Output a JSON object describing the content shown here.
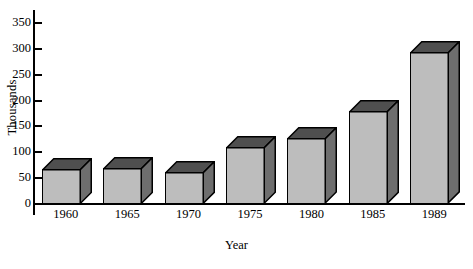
{
  "chart_data": {
    "type": "bar",
    "title": "",
    "subtitle": "",
    "xlabel": "Year",
    "ylabel": "Thousands",
    "categories": [
      "1960",
      "1965",
      "1970",
      "1975",
      "1980",
      "1985",
      "1989"
    ],
    "values": [
      68,
      70,
      62,
      110,
      127,
      180,
      293
    ],
    "series": [
      {
        "name": "Thousands",
        "values": [
          68,
          70,
          62,
          110,
          127,
          180,
          293
        ]
      }
    ],
    "ylim": [
      0,
      375
    ],
    "yticks": [
      0,
      50,
      100,
      150,
      200,
      250,
      300,
      350
    ],
    "ytick_labels": [
      "0",
      "50",
      "100",
      "150",
      "200",
      "250",
      "300",
      "350"
    ],
    "grid": false,
    "legend": false,
    "legend_position": "none",
    "style": "3d-bar",
    "colors": {
      "bar_front": "#bdbdbd",
      "bar_top": "#4f4f4f",
      "bar_side": "#6e6e6e",
      "outline": "#000000",
      "background": "#ffffff",
      "text": "#000000"
    }
  }
}
